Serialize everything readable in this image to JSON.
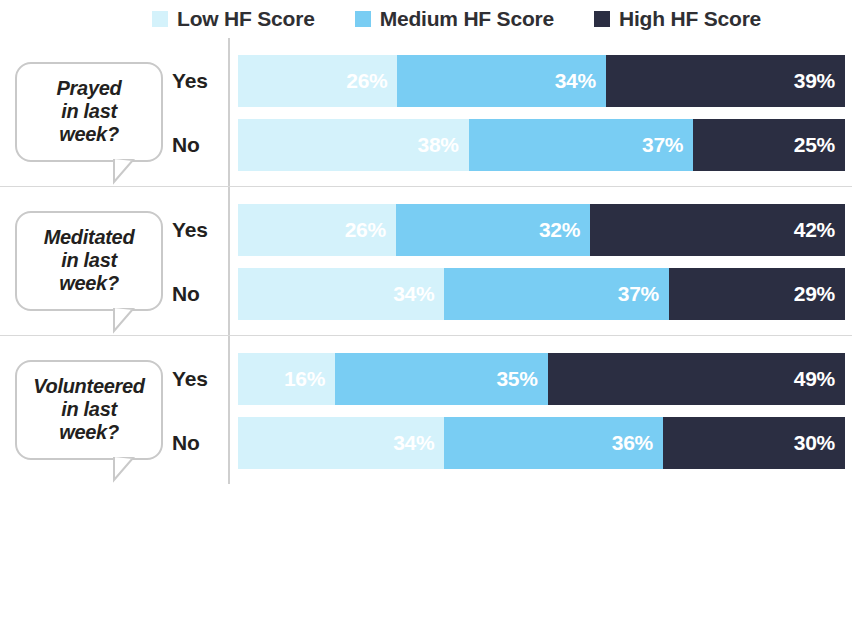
{
  "legend": {
    "items": [
      {
        "label": "Low HF Score",
        "color": "#d4f2fb",
        "key": "low"
      },
      {
        "label": "Medium HF Score",
        "color": "#79cdf3",
        "key": "medium"
      },
      {
        "label": "High HF Score",
        "color": "#2b2e42",
        "key": "high"
      }
    ]
  },
  "groups": [
    {
      "question": "Prayed\nin last\nweek?",
      "rows": [
        {
          "label": "Yes",
          "values": [
            "26%",
            "34%",
            "39%"
          ]
        },
        {
          "label": "No",
          "values": [
            "38%",
            "37%",
            "25%"
          ]
        }
      ]
    },
    {
      "question": "Meditated\nin last\nweek?",
      "rows": [
        {
          "label": "Yes",
          "values": [
            "26%",
            "32%",
            "42%"
          ]
        },
        {
          "label": "No",
          "values": [
            "34%",
            "37%",
            "29%"
          ]
        }
      ]
    },
    {
      "question": "Volunteered\nin last\nweek?",
      "rows": [
        {
          "label": "Yes",
          "values": [
            "16%",
            "35%",
            "49%"
          ]
        },
        {
          "label": "No",
          "values": [
            "34%",
            "36%",
            "30%"
          ]
        }
      ]
    }
  ],
  "chart_data": {
    "type": "bar",
    "subtype": "horizontal-stacked-100",
    "title": "",
    "xlabel": "",
    "ylabel": "",
    "xlim": [
      0,
      100
    ],
    "grid": false,
    "legend_position": "top",
    "legend_entries": [
      "Low HF Score",
      "Medium HF Score",
      "High HF Score"
    ],
    "colors": {
      "low": "#d4f2fb",
      "medium": "#79cdf3",
      "high": "#2b2e42"
    },
    "categories": [
      "Prayed in last week? - Yes",
      "Prayed in last week? - No",
      "Meditated in last week? - Yes",
      "Meditated in last week? - No",
      "Volunteered in last week? - Yes",
      "Volunteered in last week? - No"
    ],
    "series": [
      {
        "name": "Low HF Score",
        "values": [
          26,
          38,
          26,
          34,
          16,
          34
        ]
      },
      {
        "name": "Medium HF Score",
        "values": [
          34,
          37,
          32,
          37,
          35,
          36
        ]
      },
      {
        "name": "High HF Score",
        "values": [
          39,
          25,
          42,
          29,
          49,
          30
        ]
      }
    ],
    "annotations": [
      "26%",
      "34%",
      "39%",
      "38%",
      "37%",
      "25%",
      "26%",
      "32%",
      "42%",
      "34%",
      "37%",
      "29%",
      "16%",
      "35%",
      "49%",
      "34%",
      "36%",
      "30%"
    ]
  }
}
